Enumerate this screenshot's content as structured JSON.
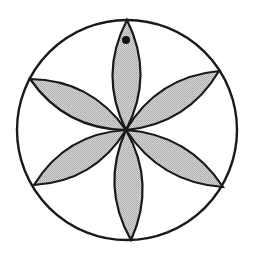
{
  "figure": {
    "colors": {
      "background": "#ffffff",
      "stroke": "#1a1a1a",
      "petal_fill": "#c9c9c9",
      "dot": "#111111"
    },
    "circle": {
      "cx": 127,
      "cy": 130,
      "r": 110
    },
    "center": {
      "x": 126,
      "y": 130
    },
    "petals": [
      {
        "name": "top",
        "tip": [
          127,
          20
        ],
        "c1": [
          154.5,
          75.3
        ],
        "c2": [
          98.5,
          74.7
        ]
      },
      {
        "name": "upper-right",
        "tip": [
          219,
          71
        ],
        "c1": [
          187.5,
          124.2
        ],
        "c2": [
          157.5,
          76.8
        ]
      },
      {
        "name": "lower-right",
        "tip": [
          223,
          187
        ],
        "c1": [
          160.3,
          182.6
        ],
        "c2": [
          188.7,
          134.4
        ]
      },
      {
        "name": "bottom",
        "tip": [
          131,
          240
        ],
        "c1": [
          100.5,
          186.3
        ],
        "c2": [
          156.5,
          183.7
        ]
      },
      {
        "name": "lower-left",
        "tip": [
          34,
          185
        ],
        "c1": [
          65.6,
          133.5
        ],
        "c2": [
          94.4,
          181.5
        ]
      },
      {
        "name": "upper-left",
        "tip": [
          30,
          79
        ],
        "c1": [
          91.1,
          79.8
        ],
        "c2": [
          64.9,
          129.2
        ]
      }
    ],
    "dot": {
      "cx": 126,
      "cy": 40,
      "r": 4
    }
  }
}
